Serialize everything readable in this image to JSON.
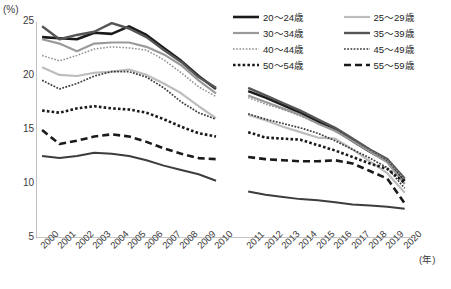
{
  "unit_label": "(%)",
  "x_unit_label": "(年)",
  "title": "",
  "legend": {
    "items": [
      {
        "label": "20～24歳",
        "key": "20-24",
        "color": "#1a1a1a",
        "width": 2.6,
        "dash": "none"
      },
      {
        "label": "25～29歳",
        "key": "25-29",
        "color": "#bdbdbd",
        "width": 2.2,
        "dash": "none"
      },
      {
        "label": "30～34歳",
        "key": "30-34",
        "color": "#9a9a9a",
        "width": 2.2,
        "dash": "none"
      },
      {
        "label": "35～39歳",
        "key": "35-39",
        "color": "#555555",
        "width": 2.4,
        "dash": "none"
      },
      {
        "label": "40～44歳",
        "key": "40-44",
        "color": "#8f8f8f",
        "width": 1.5,
        "dash": "1.6,1.6"
      },
      {
        "label": "45～49歳",
        "key": "45-49",
        "color": "#3d3d3d",
        "width": 1.7,
        "dash": "1.8,1.4"
      },
      {
        "label": "50～54歳",
        "key": "50-54",
        "color": "#1a1a1a",
        "width": 2.6,
        "dash": "2.6,2.2"
      },
      {
        "label": "55～59歳",
        "key": "55-59",
        "color": "#1a1a1a",
        "width": 2.6,
        "dash": "7,4"
      }
    ]
  },
  "chart_data": {
    "type": "line",
    "title": "",
    "xlabel": "年",
    "ylabel": "%",
    "ylim": [
      5,
      25
    ],
    "yticks": [
      5,
      10,
      15,
      20,
      25
    ],
    "grid": false,
    "legend_position": "top-right",
    "note": "series are broken between 2010 and 2011 (no connecting segment)",
    "x": [
      2000,
      2001,
      2002,
      2003,
      2004,
      2005,
      2006,
      2007,
      2008,
      2009,
      2010,
      2011,
      2012,
      2013,
      2014,
      2015,
      2016,
      2017,
      2018,
      2019,
      2020
    ],
    "series": [
      {
        "name": "20～24歳",
        "color": "#1a1a1a",
        "values": [
          23.6,
          23.5,
          23.4,
          24.0,
          23.9,
          24.6,
          23.8,
          22.6,
          21.4,
          20.0,
          18.8,
          18.6,
          18.0,
          17.3,
          16.6,
          15.8,
          15.0,
          14.0,
          13.0,
          12.1,
          10.3
        ]
      },
      {
        "name": "25～29歳",
        "color": "#bdbdbd",
        "values": [
          20.8,
          20.1,
          20.0,
          20.3,
          20.4,
          20.6,
          20.1,
          19.3,
          18.4,
          17.2,
          16.1,
          16.4,
          15.9,
          15.3,
          14.8,
          14.3,
          14.2,
          13.2,
          12.1,
          11.0,
          9.2
        ]
      },
      {
        "name": "30～34歳",
        "color": "#9a9a9a",
        "values": [
          23.4,
          23.0,
          22.3,
          23.0,
          23.1,
          23.1,
          22.7,
          22.0,
          21.0,
          19.6,
          18.4,
          18.2,
          17.6,
          17.0,
          16.4,
          15.6,
          14.9,
          14.0,
          13.0,
          12.0,
          10.0
        ]
      },
      {
        "name": "35～39歳",
        "color": "#555555",
        "values": [
          24.6,
          23.4,
          23.8,
          24.1,
          24.9,
          24.4,
          23.6,
          22.4,
          21.3,
          19.9,
          18.9,
          18.9,
          18.2,
          17.5,
          16.8,
          16.0,
          15.2,
          14.2,
          13.2,
          12.3,
          10.5
        ]
      },
      {
        "name": "40～44歳",
        "color": "#8f8f8f",
        "values": [
          21.9,
          21.4,
          21.9,
          22.5,
          22.7,
          22.6,
          22.4,
          21.5,
          20.3,
          19.0,
          18.1,
          18.0,
          17.4,
          16.9,
          16.3,
          15.6,
          15.0,
          14.0,
          13.1,
          12.2,
          10.4
        ]
      },
      {
        "name": "45～49歳",
        "color": "#3d3d3d",
        "values": [
          19.6,
          18.8,
          19.3,
          20.0,
          20.4,
          20.4,
          19.9,
          18.9,
          17.6,
          16.6,
          16.0,
          16.5,
          16.0,
          15.6,
          15.2,
          14.7,
          14.0,
          13.2,
          12.4,
          11.5,
          9.6
        ]
      },
      {
        "name": "50～54歳",
        "color": "#1a1a1a",
        "values": [
          16.8,
          16.6,
          17.0,
          17.2,
          17.0,
          16.9,
          16.6,
          16.0,
          15.3,
          14.7,
          14.4,
          14.8,
          14.3,
          14.2,
          14.1,
          13.6,
          13.1,
          12.5,
          11.9,
          11.4,
          10.1
        ]
      },
      {
        "name": "55～59歳",
        "color": "#1a1a1a",
        "values": [
          15.0,
          13.7,
          14.0,
          14.4,
          14.6,
          14.4,
          13.9,
          13.3,
          12.8,
          12.4,
          12.3,
          12.5,
          12.3,
          12.2,
          12.1,
          12.1,
          12.2,
          11.9,
          11.2,
          10.5,
          8.2
        ]
      },
      {
        "name": "60歳以上",
        "color": "#3d3d3d",
        "values": [
          12.6,
          12.4,
          12.6,
          12.9,
          12.8,
          12.6,
          12.2,
          11.7,
          11.3,
          10.9,
          10.3,
          9.3,
          9.0,
          8.8,
          8.6,
          8.5,
          8.3,
          8.1,
          8.0,
          7.9,
          7.7
        ]
      }
    ]
  }
}
